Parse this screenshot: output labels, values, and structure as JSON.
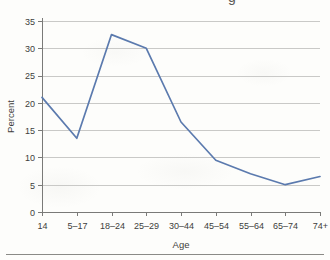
{
  "figure": {
    "clipped_title_fragment": "g",
    "background_color": "#fdfdfb",
    "bottom_rule": true
  },
  "chart_data": {
    "type": "line",
    "title": "",
    "xlabel": "Age",
    "ylabel": "Percent",
    "categories": [
      "14",
      "5–17",
      "18–24",
      "25–29",
      "30–44",
      "45–54",
      "55–64",
      "65–74",
      "74+"
    ],
    "values": [
      21,
      13.5,
      32.5,
      30,
      16.5,
      9.5,
      7,
      5,
      6.5
    ],
    "ylim": [
      0,
      35
    ],
    "ytick_values": [
      0,
      5,
      10,
      15,
      20,
      25,
      30,
      35
    ],
    "ytick_labels": [
      "0",
      "5",
      "10",
      "15",
      "20",
      "25",
      "30",
      "35"
    ],
    "grid": "horizontal",
    "legend": "none",
    "series_color": "#5b7aae",
    "gridline_color": "#c9c9c7",
    "axis_color": "#7a7a78",
    "marker": "none"
  }
}
